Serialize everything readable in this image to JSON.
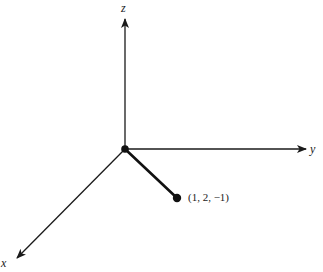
{
  "diagram": {
    "type": "3d-coordinate-axes",
    "axes": {
      "z": {
        "label": "z",
        "direction": "up"
      },
      "y": {
        "label": "y",
        "direction": "right"
      },
      "x": {
        "label": "x",
        "direction": "down-left"
      }
    },
    "origin": {
      "marker": "filled-dot"
    },
    "point": {
      "label": "(1, 2, −1)",
      "coordinates": [
        1,
        2,
        -1
      ],
      "marker": "filled-dot"
    },
    "colors": {
      "ink": "#1a1a1a",
      "background": "#ffffff"
    }
  }
}
